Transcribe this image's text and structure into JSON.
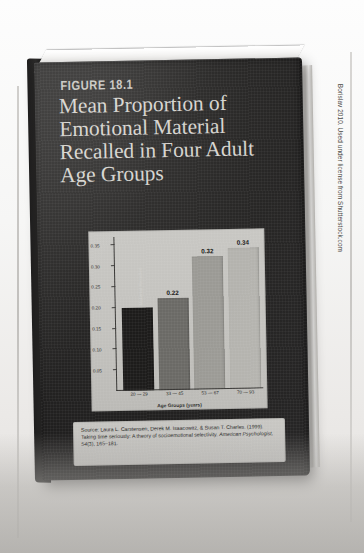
{
  "figure": {
    "number_label": "FIGURE 18.1",
    "title_lines": [
      "Mean Proportion of",
      "Emotional Material",
      "Recalled in Four Adult",
      "Age Groups"
    ]
  },
  "chart_data": {
    "type": "bar",
    "title": "Mean Proportion of Emotional Material Recalled in Four Adult Age Groups",
    "categories": [
      "20 — 29",
      "33 — 45",
      "53 — 67",
      "70 — 93"
    ],
    "values": [
      0.2,
      0.22,
      0.32,
      0.34
    ],
    "value_labels": [
      "",
      "0.22",
      "0.32",
      "0.34"
    ],
    "bar_colors": [
      "#1d1c1b",
      "#6b6a66",
      "#9b9a95",
      "#b4b3ae"
    ],
    "xlabel": "Age Groups (years)",
    "ylabel": "Mean Proportion of Emotional Material Recalled",
    "ylim": [
      0,
      0.37
    ],
    "yticks": [
      0.05,
      0.1,
      0.15,
      0.2,
      0.25,
      0.3,
      0.35
    ],
    "ytick_labels": [
      "0.05",
      "0.10",
      "0.15",
      "0.20",
      "0.25",
      "0.30",
      "0.35"
    ],
    "grid": false,
    "legend": "none",
    "plot_background": "#c5c4c0"
  },
  "source": {
    "line1": "Source: Laura L. Carstensen, Derek M. Isaacowitz, & Susan T. Charles. (1999).",
    "line2": "Taking time seriously: A theory of socioemotional selectivity. ",
    "line2_italic": "American",
    "line3_italic": "Psychologist, 54",
    "line3": "(3), 165–181."
  },
  "photo_credit": "Borislav 2010. Used under license from Shutterstock.com",
  "colors": {
    "cover": "#2a2928",
    "cover_text": "#d6d4cf",
    "panel": "#c5c4c0",
    "axis": "#3a3937"
  }
}
